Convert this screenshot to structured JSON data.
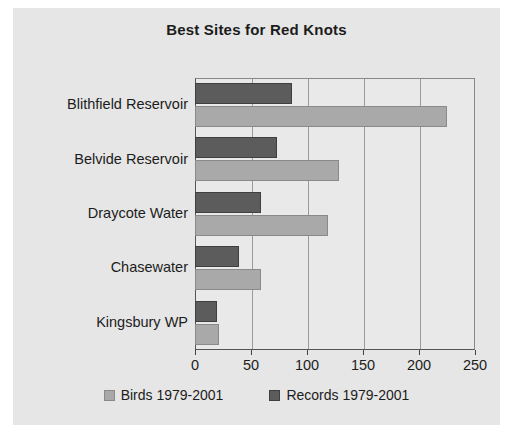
{
  "chart_data": {
    "type": "bar",
    "orientation": "horizontal",
    "title": "Best Sites for Red Knots",
    "categories": [
      "Blithfield Reservoir",
      "Belvide Reservoir",
      "Draycote Water",
      "Chasewater",
      "Kingsbury WP"
    ],
    "series": [
      {
        "name": "Birds 1979-2001",
        "color": "#a9a9a9",
        "values": [
          225,
          129,
          119,
          59,
          21
        ]
      },
      {
        "name": "Records 1979-2001",
        "color": "#5c5c5c",
        "values": [
          87,
          73,
          59,
          39,
          20
        ]
      }
    ],
    "xlabel": "",
    "ylabel": "",
    "xlim": [
      0,
      250
    ],
    "xticks": [
      0,
      50,
      100,
      150,
      200,
      250
    ],
    "xtick_labels": [
      "0",
      "50",
      "100",
      "150",
      "200",
      "250"
    ],
    "grid": true,
    "grid_axis": "x",
    "legend_position": "bottom"
  },
  "colors": {
    "chart_background": "#e6e6e6",
    "plot_background": "#e9e9e9",
    "axis": "#555555",
    "gridline": "#9a9a9a",
    "text": "#1c1c1c"
  }
}
